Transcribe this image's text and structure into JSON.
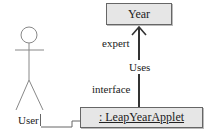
{
  "diagram": {
    "type": "uml-collaboration",
    "nodes": {
      "year": {
        "label": "Year"
      },
      "applet": {
        "label": ": LeapYearApplet"
      },
      "actor": {
        "label": "User"
      }
    },
    "edges": {
      "uses": {
        "label": "Uses"
      },
      "expert": {
        "label": "expert"
      },
      "interface": {
        "label": "interface"
      }
    },
    "colors": {
      "box_fill": "#e6e6e6",
      "stroke": "#555555",
      "arrow": "#333333"
    }
  }
}
